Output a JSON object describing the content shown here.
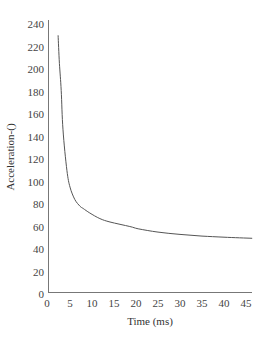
{
  "chart_data": {
    "type": "line",
    "title": "",
    "xlabel": "Time (ms)",
    "ylabel": "Acceleration-()",
    "xlim": [
      0,
      47
    ],
    "ylim": [
      0,
      240
    ],
    "x_ticks": [
      0,
      5,
      10,
      15,
      20,
      25,
      30,
      35,
      40,
      45
    ],
    "y_ticks": [
      0,
      20,
      40,
      60,
      80,
      100,
      120,
      140,
      160,
      180,
      200,
      220,
      240
    ],
    "grid": false,
    "legend": null,
    "series": [
      {
        "name": "Acceleration",
        "color": "#555555",
        "x": [
          2.3,
          2.6,
          3.0,
          3.4,
          4.3,
          5.0,
          6.1,
          7.3,
          8.0,
          9.5,
          11.8,
          14.1,
          18.6,
          20.5,
          25,
          30,
          35,
          40,
          46.4
        ],
        "y": [
          230,
          205,
          181,
          146,
          110,
          95,
          84,
          78,
          76,
          72,
          67,
          64,
          60,
          58,
          55,
          53,
          51.5,
          50.5,
          49.5
        ]
      }
    ]
  },
  "plot": {
    "x_axis_label": "Time (ms)",
    "y_axis_label": "Acceleration-()"
  }
}
